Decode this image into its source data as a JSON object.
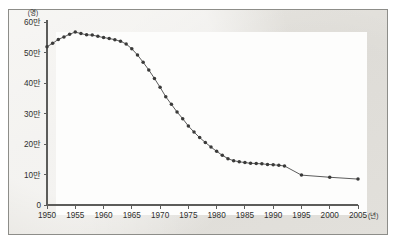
{
  "figure": {
    "background_color": "#e9e7e2",
    "plot_background_color": "#fdfdfc",
    "border_color": "#8d8d89",
    "line_color": "#4a4a49",
    "marker_color": "#3a3a39",
    "axis_color": "#5c5c5a"
  },
  "chart_data": {
    "type": "line",
    "title": "",
    "subtitle": "",
    "xlabel": "",
    "ylabel": "",
    "y_unit_label": "(명)",
    "x_unit_label": "(년)",
    "xlim": [
      1950,
      2005
    ],
    "ylim": [
      0,
      600000
    ],
    "grid": false,
    "legend": null,
    "y_ticks": [
      0,
      100000,
      200000,
      300000,
      400000,
      500000,
      600000
    ],
    "y_tick_labels": [
      "0",
      "10만",
      "20만",
      "30만",
      "40만",
      "50만",
      "60만"
    ],
    "x_ticks": [
      1950,
      1955,
      1960,
      1965,
      1970,
      1975,
      1980,
      1985,
      1990,
      1995,
      2000,
      2005
    ],
    "x_tick_labels": [
      "1950",
      "1955",
      "1960",
      "1965",
      "1970",
      "1975",
      "1980",
      "1985",
      "1990",
      "1995",
      "2000",
      "2005"
    ],
    "markers": true,
    "series": [
      {
        "name": "births",
        "x": [
          1950,
          1951,
          1952,
          1953,
          1954,
          1955,
          1956,
          1957,
          1958,
          1959,
          1960,
          1961,
          1962,
          1963,
          1964,
          1965,
          1966,
          1967,
          1968,
          1969,
          1970,
          1971,
          1972,
          1973,
          1974,
          1975,
          1976,
          1977,
          1978,
          1979,
          1980,
          1981,
          1982,
          1983,
          1984,
          1985,
          1986,
          1987,
          1988,
          1989,
          1990,
          1991,
          1992,
          1995,
          2000,
          2005
        ],
        "values": [
          519000,
          530000,
          543000,
          551000,
          560000,
          567000,
          562000,
          558000,
          557000,
          553000,
          549000,
          546000,
          542000,
          537000,
          528000,
          512000,
          492000,
          468000,
          443000,
          415000,
          386000,
          355000,
          330000,
          305000,
          283000,
          259000,
          239000,
          221000,
          205000,
          190000,
          176000,
          163000,
          152000,
          145000,
          142000,
          139000,
          137000,
          136000,
          135000,
          133000,
          132000,
          130000,
          128000,
          98000,
          91000,
          85000
        ]
      }
    ]
  }
}
